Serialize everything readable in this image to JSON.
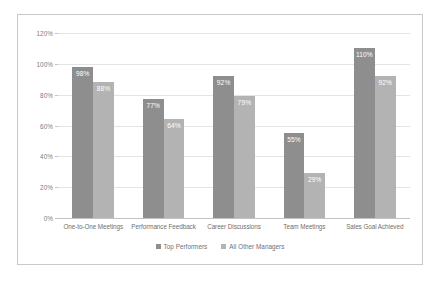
{
  "chart_data": {
    "type": "bar",
    "title": "",
    "xlabel": "",
    "ylabel": "",
    "ylim": [
      0,
      120
    ],
    "ytick_labels": [
      "0%",
      "20%",
      "40%",
      "60%",
      "80%",
      "100%",
      "120%"
    ],
    "ytick_values": [
      0,
      20,
      40,
      60,
      80,
      100,
      120
    ],
    "grid": true,
    "legend_position": "bottom",
    "categories": [
      "One-to-One Meetings",
      "Performance Feedback",
      "Career Discussions",
      "Team Meetings",
      "Sales Goal Achieved"
    ],
    "series": [
      {
        "name": "Top Performers",
        "color": "#8e8e8e",
        "values": [
          98,
          77,
          92,
          55,
          110
        ],
        "labels": [
          "98%",
          "77%",
          "92%",
          "55%",
          "110%"
        ]
      },
      {
        "name": "All Other Managers",
        "color": "#b3b3b3",
        "values": [
          88,
          64,
          79,
          29,
          92
        ],
        "labels": [
          "88%",
          "64%",
          "79%",
          "29%",
          "92%"
        ]
      }
    ]
  },
  "frame": {
    "border_color": "#c9c9c9",
    "background": "#ffffff",
    "gridline_color": "#e4e4e4",
    "tick_text_color": "#7c7c7c"
  }
}
